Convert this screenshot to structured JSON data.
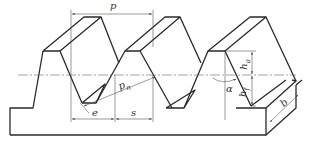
{
  "diagram": {
    "title": "",
    "type": "gear rack basic tooth profile (isometric)",
    "labels": {
      "pitch": "p",
      "normal_pitch": "p",
      "normal_pitch_sub": "n",
      "space_width": "e",
      "tooth_thickness": "s",
      "pressure_angle": "α",
      "addendum": "h",
      "addendum_sub": "a",
      "dedendum": "h",
      "dedendum_sub": "f",
      "face_width": "b"
    },
    "nodes": [
      {
        "id": "rack-body",
        "label": "rack body"
      },
      {
        "id": "tooth-1",
        "label": "tooth 1"
      },
      {
        "id": "tooth-2",
        "label": "tooth 2"
      },
      {
        "id": "tooth-3",
        "label": "tooth 3"
      },
      {
        "id": "pitch-line",
        "label": "pitch line"
      }
    ],
    "colors": {
      "line": "#2a2a2a",
      "dim": "#555555",
      "background": "#ffffff"
    }
  }
}
